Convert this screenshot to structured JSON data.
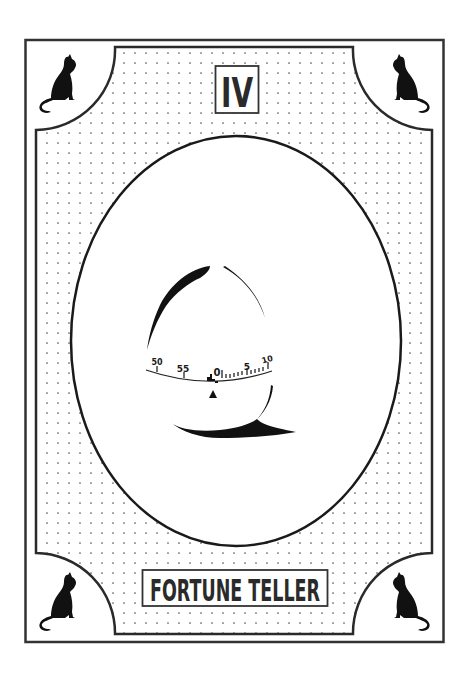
{
  "card": {
    "numeral": "IV",
    "title": "FORTUNE TELLER",
    "colors": {
      "ink": "#1a1a1a",
      "frame": "#333333",
      "background": "#ffffff",
      "dots": "#555555"
    }
  },
  "timer": {
    "dial_labels": [
      "50",
      "55",
      "0",
      "5",
      "10"
    ],
    "pointer": "triangle-up"
  },
  "corners": [
    {
      "position": "top-left",
      "icon": "cat-silhouette-icon",
      "facing": "right"
    },
    {
      "position": "top-right",
      "icon": "cat-silhouette-icon",
      "facing": "left"
    },
    {
      "position": "bottom-left",
      "icon": "cat-silhouette-icon",
      "facing": "right"
    },
    {
      "position": "bottom-right",
      "icon": "cat-silhouette-icon",
      "facing": "left"
    }
  ]
}
